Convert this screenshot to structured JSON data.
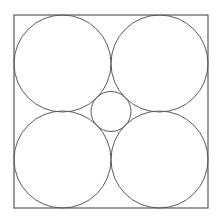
{
  "diagram": {
    "title": "",
    "stroke_color": "#5a5a5a",
    "background": "#ffffff",
    "square": {
      "x": 14,
      "y": 15,
      "width": 194,
      "height": 193
    },
    "large_circles": [
      {
        "position": "top-left",
        "cx": 62.5,
        "cy": 63.5,
        "r": 48.5
      },
      {
        "position": "top-right",
        "cx": 159.5,
        "cy": 63.5,
        "r": 48.5
      },
      {
        "position": "bottom-left",
        "cx": 62.5,
        "cy": 159.5,
        "r": 48.5
      },
      {
        "position": "bottom-right",
        "cx": 159.5,
        "cy": 159.5,
        "r": 48.5
      }
    ],
    "center_circle": {
      "position": "center",
      "cx": 111,
      "cy": 111.5,
      "r": 20
    }
  }
}
